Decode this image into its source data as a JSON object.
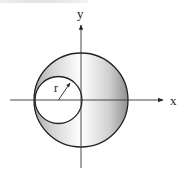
{
  "figure": {
    "axes": {
      "x_label": "x",
      "y_label": "y",
      "origin": [
        81,
        100
      ],
      "x_axis": {
        "from": 10,
        "to": 163,
        "y": 100
      },
      "y_axis": {
        "from": 168,
        "to": 25,
        "x": 81
      }
    },
    "large_circle": {
      "cx": 81,
      "cy": 100,
      "r": 47
    },
    "small_circle": {
      "cx": 58.5,
      "cy": 100,
      "r": 23.5
    },
    "radius_marker": {
      "label": "r",
      "from": [
        58.5,
        100
      ],
      "to": [
        70,
        83
      ]
    },
    "colors": {
      "stroke": "#222222",
      "shade_light": "#ffffff",
      "shade_dark": "#9a9a9a",
      "hole_fill": "#ffffff"
    },
    "shaded_region": "large circle minus small circle"
  }
}
